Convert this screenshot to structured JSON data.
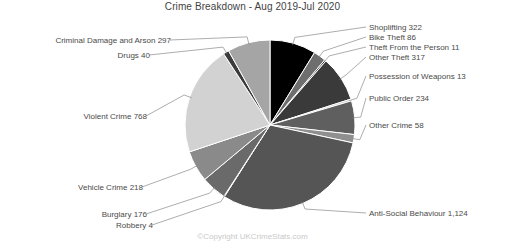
{
  "chart_data": {
    "type": "pie",
    "title": "Crime Breakdown - Aug 2019-Jul 2020",
    "legend_position": "callout-labels",
    "total": 3668,
    "start_angle_deg": 0,
    "direction": "clockwise",
    "categories": [
      "Shoplifting",
      "Bike Theft",
      "Theft From the Person",
      "Other Theft",
      "Possession of Weapons",
      "Public Order",
      "Other Crime",
      "Anti-Social Behaviour",
      "Robbery",
      "Burglary",
      "Vehicle Crime",
      "Violent Crime",
      "Drugs",
      "Criminal Damage and Arson"
    ],
    "values": [
      322,
      86,
      11,
      317,
      13,
      234,
      58,
      1124,
      4,
      176,
      218,
      768,
      40,
      297
    ],
    "value_labels": [
      "322",
      "86",
      "11",
      "317",
      "13",
      "234",
      "58",
      "1,124",
      "4",
      "176",
      "218",
      "768",
      "40",
      "297"
    ],
    "colors": [
      "#000000",
      "#6e6e6e",
      "#2f2f2f",
      "#3a3a3a",
      "#c2c2c2",
      "#5f5f5f",
      "#8f8f8f",
      "#555555",
      "#9a9a9a",
      "#6a6a6a",
      "#8a8a8a",
      "#d2d2d2",
      "#3c3c3c",
      "#a5a5a5"
    ],
    "slice_labels": [
      "Shoplifting 322",
      "Bike Theft 86",
      "Theft From the Person 11",
      "Other Theft 317",
      "Possession of Weapons 13",
      "Public Order 234",
      "Other Crime 58",
      "Anti-Social Behaviour 1,124",
      "Robbery 4",
      "Burglary 176",
      "Vehicle Crime 218",
      "Violent Crime 768",
      "Drugs 40",
      "Criminal Damage and Arson 297"
    ]
  },
  "footer": {
    "copyright": "©Copyright UKCrimeStats.com"
  }
}
